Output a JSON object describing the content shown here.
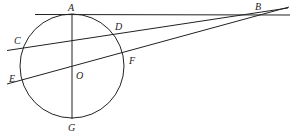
{
  "figure": {
    "type": "geometry",
    "circle": {
      "center": "O",
      "cx": 72,
      "cy": 66,
      "r": 52
    },
    "points": {
      "A": {
        "label": "A",
        "x": 72,
        "y": 14
      },
      "B": {
        "label": "B",
        "x": 258,
        "y": 15
      },
      "C": {
        "label": "C",
        "x": 22,
        "y": 48
      },
      "D": {
        "label": "D",
        "x": 117,
        "y": 31
      },
      "E": {
        "label": "E",
        "x": 20,
        "y": 80
      },
      "F": {
        "label": "F",
        "x": 125,
        "y": 56
      },
      "O": {
        "label": "O",
        "x": 72,
        "y": 67
      },
      "G": {
        "label": "G",
        "x": 72,
        "y": 119
      }
    },
    "segments": [
      {
        "name": "tangent-AB",
        "from": "A",
        "to": "B"
      },
      {
        "name": "secant-BDC",
        "from": "B",
        "to": "C"
      },
      {
        "name": "secant-BFE",
        "from": "B",
        "to": "E"
      },
      {
        "name": "diameter-AG",
        "from": "A",
        "to": "G"
      }
    ],
    "labels": {
      "A": "A",
      "B": "B",
      "C": "C",
      "D": "D",
      "E": "E",
      "F": "F",
      "O": "O",
      "G": "G"
    }
  }
}
